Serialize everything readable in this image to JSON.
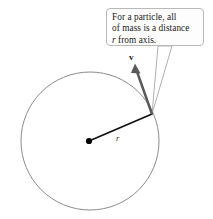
{
  "figure": {
    "background_color": "#ffffff"
  },
  "callout": {
    "text": "For a particle, all of mass is a distance r from axis.",
    "line1": "For a particle, all",
    "line2": "of mass is a distance",
    "line3_prefix": "",
    "line3_symbol": "r",
    "line3_suffix": " from axis.",
    "border_color": "#b9b9b9",
    "fill_color": "#fdfdfd",
    "text_color": "#1a1a1a"
  },
  "labels": {
    "velocity": "v",
    "radius": "r"
  },
  "geometry": {
    "circle": {
      "cx": 90,
      "cy": 141,
      "r": 69,
      "stroke": "#8c8c8c",
      "stroke_width": 1,
      "fill": "none"
    },
    "center_dot": {
      "cx": 89,
      "cy": 141,
      "r": 3,
      "fill": "#000000"
    },
    "particle": {
      "x": 152,
      "y": 114
    },
    "radius_line": {
      "x1": 89,
      "y1": 141,
      "x2": 152,
      "y2": 114,
      "stroke": "#101010",
      "stroke_width": 1.6
    },
    "velocity_arrow": {
      "x1": 152,
      "y1": 114,
      "x2": 135,
      "y2": 65,
      "stroke": "#5a5a5a",
      "stroke_width": 2.4,
      "head_length": 9,
      "head_width": 6
    },
    "leader": {
      "box_left_x": 158,
      "box_right_x": 172,
      "box_y": 46,
      "tip_x": 152,
      "tip_y": 114,
      "stroke": "#a8a8a8",
      "stroke_width": 0.9
    }
  }
}
